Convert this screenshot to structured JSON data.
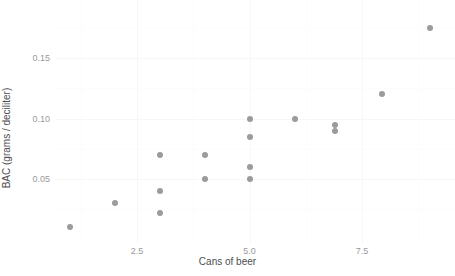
{
  "chart_data": {
    "type": "scatter",
    "title": "",
    "xlabel": "Cans of beer",
    "ylabel": "BAC (grams / deciliter)",
    "xlim": [
      0.6,
      9.4
    ],
    "ylim": [
      0.005,
      0.181
    ],
    "xticks": [
      2.5,
      5.0,
      7.5
    ],
    "xtick_labels": [
      "2.5",
      "5.0",
      "7.5"
    ],
    "yticks": [
      0.05,
      0.1,
      0.15
    ],
    "ytick_labels": [
      "0.05",
      "0.10",
      "0.15"
    ],
    "x_minor_ticks": [
      1.25,
      3.75,
      6.25,
      8.75
    ],
    "y_minor_ticks": [
      0.025,
      0.075,
      0.125,
      0.175
    ],
    "grid": true,
    "legend": null,
    "point_color": "#9b9b9b",
    "point_size": 6,
    "background_color": "#ffffff",
    "grid_color": "#f7f7f7",
    "tick_label_color": "#9a9a9a",
    "axis_title_color": "#4d4d4d",
    "points": [
      {
        "x": 1.0,
        "y": 0.01
      },
      {
        "x": 2.0,
        "y": 0.03
      },
      {
        "x": 3.0,
        "y": 0.07
      },
      {
        "x": 3.0,
        "y": 0.04
      },
      {
        "x": 3.0,
        "y": 0.022
      },
      {
        "x": 4.0,
        "y": 0.07
      },
      {
        "x": 4.0,
        "y": 0.05
      },
      {
        "x": 5.0,
        "y": 0.1
      },
      {
        "x": 5.0,
        "y": 0.085
      },
      {
        "x": 5.0,
        "y": 0.06
      },
      {
        "x": 5.0,
        "y": 0.05
      },
      {
        "x": 6.0,
        "y": 0.1
      },
      {
        "x": 6.9,
        "y": 0.095
      },
      {
        "x": 6.9,
        "y": 0.09
      },
      {
        "x": 7.95,
        "y": 0.12
      },
      {
        "x": 9.0,
        "y": 0.175
      }
    ]
  }
}
